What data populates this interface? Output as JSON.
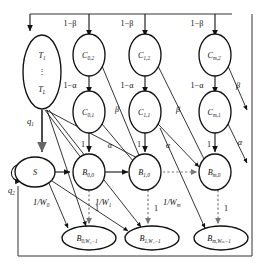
{
  "figure": {
    "type": "markov-chain-state-transition-diagram",
    "width": 266,
    "height": 268,
    "background": "#ffffff",
    "stroke_color": "#111111"
  },
  "nodes": {
    "t": {
      "id": "T",
      "line1": "T",
      "sub1": "1",
      "dots": "⋮",
      "line2": "T",
      "sub2": "L",
      "cx": 42,
      "cy": 72,
      "rx": 19,
      "ry": 37
    },
    "s": {
      "id": "S",
      "label": "S",
      "cx": 35,
      "cy": 172,
      "rx": 20,
      "ry": 15
    },
    "c02": {
      "id": "C02",
      "label": "C",
      "sub": "0,2",
      "cx": 89,
      "cy": 55,
      "rx": 16,
      "ry": 21
    },
    "c01": {
      "id": "C01",
      "label": "C",
      "sub": "0,1",
      "cx": 89,
      "cy": 112,
      "rx": 16,
      "ry": 21
    },
    "c12": {
      "id": "C12",
      "label": "C",
      "sub": "1,2",
      "cx": 145,
      "cy": 55,
      "rx": 16,
      "ry": 21
    },
    "c11": {
      "id": "C11",
      "label": "C",
      "sub": "1,1",
      "cx": 145,
      "cy": 112,
      "rx": 16,
      "ry": 21
    },
    "cm2": {
      "id": "Cm2",
      "label": "C",
      "sub": "m,2",
      "cx": 215,
      "cy": 55,
      "rx": 16,
      "ry": 21
    },
    "cm1": {
      "id": "Cm1",
      "label": "C",
      "sub": "m,1",
      "cx": 215,
      "cy": 112,
      "rx": 16,
      "ry": 21
    },
    "b00": {
      "id": "B00",
      "label": "B",
      "sub": "0,0",
      "cx": 89,
      "cy": 172,
      "rx": 16,
      "ry": 18
    },
    "b10": {
      "id": "B10",
      "label": "B",
      "sub": "1,0",
      "cx": 145,
      "cy": 172,
      "rx": 16,
      "ry": 18
    },
    "bm0": {
      "id": "Bm0",
      "label": "B",
      "sub": "m,0",
      "cx": 215,
      "cy": 172,
      "rx": 16,
      "ry": 18
    },
    "b0w": {
      "id": "B0W",
      "label": "B",
      "sub": "0,W₀−1",
      "cx": 89,
      "cy": 238,
      "rx": 27,
      "ry": 12
    },
    "b1w": {
      "id": "B1W",
      "label": "B",
      "sub": "1,W₁−1",
      "cx": 152,
      "cy": 238,
      "rx": 27,
      "ry": 12
    },
    "bmw": {
      "id": "BmW",
      "label": "B",
      "sub": "m,Wₘ−1",
      "cx": 221,
      "cy": 238,
      "rx": 27,
      "ry": 12
    }
  },
  "edge_labels": {
    "one_minus_beta_0": "1−β",
    "one_minus_beta_1": "1−β",
    "one_minus_beta_m": "1−β",
    "one_minus_alpha_0": "1−α",
    "one_minus_alpha_1": "1−α",
    "one_minus_alpha_m": "1−α",
    "beta_0": "β",
    "beta_1": "β",
    "beta_m": "β",
    "alpha_0": "α",
    "alpha_1": "α",
    "alpha_m": "α",
    "q1": "q",
    "q1_sub": "1",
    "q2": "q",
    "q2_sub": "2",
    "one_w0": "1/W",
    "one_w0_sub": "0",
    "one_w1": "1/W",
    "one_w1_sub": "1",
    "one_wm": "1/W",
    "one_wm_sub": "m",
    "one_c0b": "1",
    "one_c1b": "1",
    "one_cmb": "1",
    "one_b0": "1",
    "one_b1": "1",
    "one_bm": "1"
  }
}
